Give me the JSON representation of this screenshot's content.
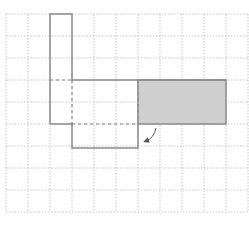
{
  "diagram": {
    "type": "grid-shape-transformation",
    "grid": {
      "origin_x": 6,
      "origin_y": 14,
      "cell_size": 22,
      "columns": 11,
      "rows": 9,
      "line_color": "#b8b8b8",
      "line_style": "dotted"
    },
    "colors": {
      "outline": "#8a8a8a",
      "shaded_fill": "#cfcfcf",
      "dashed": "#8a8a8a",
      "arrow": "#555555"
    },
    "shapes": {
      "original_outline_solid": "M50,124 L50,14 L72,14 L72,80 L226,80",
      "lower_piece_solid": "M50,124 L72,124 L72,148 L138,148 L138,124",
      "shaded_rect": {
        "x": 138,
        "y": 80,
        "width": 88,
        "height": 44
      },
      "dashed_lines": [
        "M50,80 L72,80",
        "M72,80 L72,124",
        "M72,124 L138,124",
        "M138,80 L138,124"
      ]
    },
    "arrow": {
      "path": "M156,128 Q154,138 146,141",
      "description": "curved arrow pointing down-left from shaded region to lower piece"
    }
  }
}
